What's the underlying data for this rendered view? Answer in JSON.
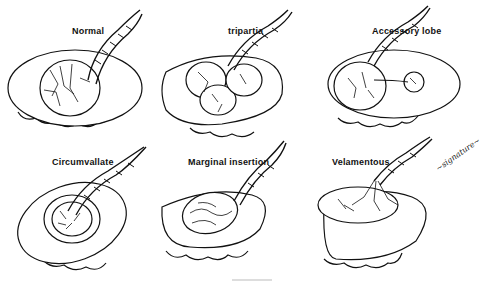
{
  "figure": {
    "panels": [
      {
        "id": "normal",
        "label": "Normal"
      },
      {
        "id": "tripartia",
        "label": "tripartia"
      },
      {
        "id": "accessory-lobe",
        "label": "Accessory lobe"
      },
      {
        "id": "circumvallate",
        "label": "Circumvallate"
      },
      {
        "id": "marginal-insertion",
        "label": "Marginal insertion"
      },
      {
        "id": "velamentous",
        "label": "Velamentous"
      }
    ],
    "signature": "~signature~"
  },
  "colors": {
    "ink": "#111111",
    "background": "#ffffff"
  }
}
